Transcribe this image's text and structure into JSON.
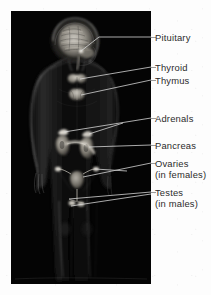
{
  "figure": {
    "title_alt": "Endocrine glands of the human body",
    "panel": {
      "background_color": "#040404",
      "width": 140,
      "height": 273
    },
    "page_background_color": "#fdfdfd",
    "label_text_color": "#2b2b2b",
    "leader_line_color": "#cfcfcf"
  },
  "labels": [
    {
      "id": "pituitary",
      "name": "Pituitary",
      "sub": "",
      "text_x": 0,
      "text_y": 32,
      "leader_y": 37,
      "target_x": 76,
      "target_y": 40
    },
    {
      "id": "thyroid",
      "name": "Thyroid",
      "sub": "",
      "text_x": 0,
      "text_y": 62,
      "leader_y": 67,
      "target_x": 71,
      "target_y": 68
    },
    {
      "id": "thymus",
      "name": "Thymus",
      "sub": "",
      "text_x": 0,
      "text_y": 75,
      "leader_y": 80,
      "target_x": 70,
      "target_y": 84
    },
    {
      "id": "adrenals",
      "name": "Adrenals",
      "sub": "",
      "text_x": 0,
      "text_y": 113,
      "leader_y": 118,
      "target_x": 66,
      "target_y": 122
    },
    {
      "id": "pancreas",
      "name": "Pancreas",
      "sub": "",
      "text_x": 0,
      "text_y": 140,
      "leader_y": 145,
      "target_x": 75,
      "target_y": 137
    },
    {
      "id": "ovaries",
      "name": "Ovaries",
      "sub": "(in females)",
      "text_x": 0,
      "text_y": 158,
      "leader_y": 163,
      "target_x": 72,
      "target_y": 166
    },
    {
      "id": "testes",
      "name": "Testes",
      "sub": "(in males)",
      "text_x": 0,
      "text_y": 187,
      "leader_y": 192,
      "target_x": 68,
      "target_y": 192
    }
  ],
  "anatomy_parts": [
    {
      "id": "brain",
      "label": "sagittal-brain-mri"
    },
    {
      "id": "body-silhouette",
      "label": "human-body-outline"
    },
    {
      "id": "thyroid-gland",
      "label": "thyroid-butterfly"
    },
    {
      "id": "thymus-gland",
      "label": "thymus"
    },
    {
      "id": "kidneys",
      "label": "kidneys-with-adrenals"
    },
    {
      "id": "pancreas-organ",
      "label": "pancreas"
    },
    {
      "id": "uterus-ovaries",
      "label": "uterus-and-ovaries"
    },
    {
      "id": "testes-organ",
      "label": "testes"
    }
  ]
}
